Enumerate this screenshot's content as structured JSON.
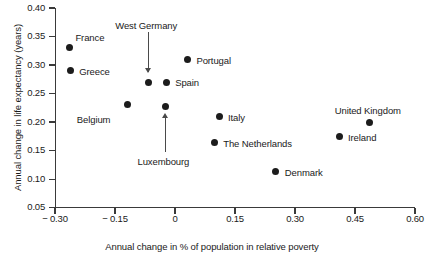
{
  "chart_data": {
    "type": "scatter",
    "title": "",
    "xlabel": "Annual change in % of population in relative poverty",
    "ylabel": "Annual change in life expectancy (years)",
    "xlim": [
      -0.3,
      0.6
    ],
    "ylim": [
      0.05,
      0.4
    ],
    "xticks": [
      "− 0.30",
      "− 0.15",
      "0",
      "0.15",
      "0.30",
      "0.45",
      "0.60"
    ],
    "xtick_values": [
      -0.3,
      -0.15,
      0,
      0.15,
      0.3,
      0.45,
      0.6
    ],
    "yticks": [
      "0.40",
      "0.35",
      "0.30",
      "0.25",
      "0.20",
      "0.15",
      "0.10",
      "0.05"
    ],
    "ytick_values": [
      0.4,
      0.35,
      0.3,
      0.25,
      0.2,
      0.15,
      0.1,
      0.05
    ],
    "grid": false,
    "legend": "none",
    "points": [
      {
        "name": "France",
        "x": -0.264,
        "y": 0.33,
        "label": "France",
        "label_dx": 6,
        "label_dy": -16,
        "label_anchor": "left"
      },
      {
        "name": "Greece",
        "x": -0.262,
        "y": 0.29,
        "label": "Greece",
        "label_dx": 9,
        "label_dy": -5,
        "label_anchor": "left"
      },
      {
        "name": "Belgium",
        "x": -0.118,
        "y": 0.23,
        "label": "Belgium",
        "label_dx": -51,
        "label_dy": 9,
        "label_anchor": "left"
      },
      {
        "name": "West Germany",
        "x": -0.067,
        "y": 0.27,
        "label": "West Germany",
        "label_dx": -2,
        "label_dy": -62,
        "label_anchor": "center",
        "annotation": "arrow-down"
      },
      {
        "name": "Luxembourg",
        "x": -0.024,
        "y": 0.227,
        "label": "Luxembourg",
        "label_dx": -2,
        "label_dy": 49,
        "label_anchor": "center",
        "annotation": "arrow-up"
      },
      {
        "name": "Spain",
        "x": -0.022,
        "y": 0.27,
        "label": "Spain",
        "label_dx": 9,
        "label_dy": -5,
        "label_anchor": "left"
      },
      {
        "name": "Portugal",
        "x": 0.031,
        "y": 0.309,
        "label": "Portugal",
        "label_dx": 9,
        "label_dy": -5,
        "label_anchor": "left"
      },
      {
        "name": "Italy",
        "x": 0.11,
        "y": 0.209,
        "label": "Italy",
        "label_dx": 9,
        "label_dy": -5,
        "label_anchor": "left"
      },
      {
        "name": "The Netherlands",
        "x": 0.098,
        "y": 0.164,
        "label": "The Netherlands",
        "label_dx": 9,
        "label_dy": -5,
        "label_anchor": "left"
      },
      {
        "name": "Denmark",
        "x": 0.252,
        "y": 0.113,
        "label": "Denmark",
        "label_dx": 9,
        "label_dy": -5,
        "label_anchor": "left"
      },
      {
        "name": "Ireland",
        "x": 0.41,
        "y": 0.174,
        "label": "Ireland",
        "label_dx": 9,
        "label_dy": -5,
        "label_anchor": "left"
      },
      {
        "name": "United Kingdom",
        "x": 0.487,
        "y": 0.199,
        "label": "United Kingdom",
        "label_dx": -2,
        "label_dy": -18,
        "label_anchor": "center"
      }
    ]
  },
  "colors": {
    "marker": "#1c1c1c",
    "axis": "#3a3a3a",
    "text": "#1a1a1a",
    "background": "#ffffff"
  }
}
